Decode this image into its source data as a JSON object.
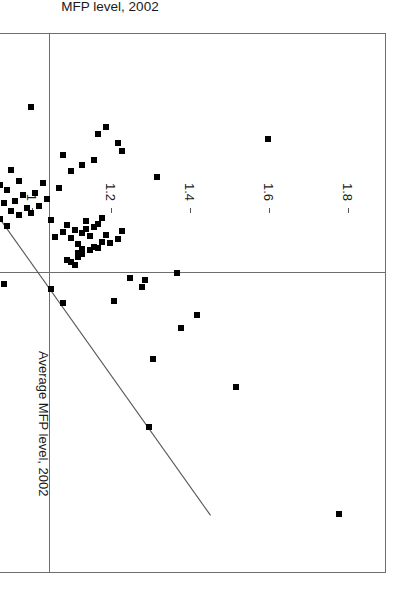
{
  "chart_data": {
    "type": "scatter",
    "title": "",
    "xlabel": "Growth among new firms within a given industry",
    "ylabel": "MFP level, 2002",
    "xlim": [
      -150,
      300
    ],
    "ylim": [
      0.5,
      1.9
    ],
    "grid": false,
    "legend": null,
    "x_ticks": [
      -150,
      -100,
      -50,
      0,
      50,
      100,
      150,
      200,
      250,
      300
    ],
    "x_tick_labels": [
      "-150",
      "-100",
      "-50",
      "0",
      "50",
      "100",
      "150",
      "200",
      "250",
      "300"
    ],
    "y_ticks": [
      0.6,
      0.8,
      1.0,
      1.2,
      1.4,
      1.6,
      1.8
    ],
    "y_tick_labels": [
      "0.6",
      "0.8",
      "1",
      "1.2",
      "1.4",
      "1.6",
      "1.8"
    ],
    "annotations": [
      {
        "text": "Average MFP level, 2002",
        "type": "vertical-reference-line",
        "y_value": 1.0
      }
    ],
    "reference_lines": [
      {
        "orientation": "horizontal",
        "value": 0,
        "axis": "x-growth"
      },
      {
        "orientation": "vertical",
        "value": 1.0,
        "axis": "y-mfp",
        "label": "Average MFP level, 2002"
      }
    ],
    "trendline": {
      "type": "linear",
      "x_start": -88,
      "y_start": 0.72,
      "x_end": 252,
      "y_end": 1.455
    },
    "marker": {
      "shape": "square",
      "color": "#000000",
      "size": 6
    },
    "points": [
      [
        251,
        1.78
      ],
      [
        178,
        1.3
      ],
      [
        145,
        1.52
      ],
      [
        122,
        1.31
      ],
      [
        96,
        1.38
      ],
      [
        85,
        1.42
      ],
      [
        75,
        1.08
      ],
      [
        73,
        1.21
      ],
      [
        63,
        1.05
      ],
      [
        62,
        1.28
      ],
      [
        59,
        0.93
      ],
      [
        56,
        1.29
      ],
      [
        54,
        1.25
      ],
      [
        50,
        1.37
      ],
      [
        43,
        1.11
      ],
      [
        41,
        1.1
      ],
      [
        39,
        1.09
      ],
      [
        37,
        1.12
      ],
      [
        36,
        0.78
      ],
      [
        34,
        1.13
      ],
      [
        33,
        1.12
      ],
      [
        31,
        1.15
      ],
      [
        30,
        1.13
      ],
      [
        29,
        1.17
      ],
      [
        28,
        1.16
      ],
      [
        26,
        1.12
      ],
      [
        25,
        1.2
      ],
      [
        24,
        1.18
      ],
      [
        22,
        1.22
      ],
      [
        21,
        1.1
      ],
      [
        20,
        1.06
      ],
      [
        19,
        1.15
      ],
      [
        18,
        1.19
      ],
      [
        17,
        1.13
      ],
      [
        16,
        1.08
      ],
      [
        15,
        1.23
      ],
      [
        14,
        1.11
      ],
      [
        13,
        1.14
      ],
      [
        12,
        1.16
      ],
      [
        11,
        0.94
      ],
      [
        10,
        1.09
      ],
      [
        9,
        1.17
      ],
      [
        8,
        0.88
      ],
      [
        7,
        1.14
      ],
      [
        6,
        1.05
      ],
      [
        5,
        0.92
      ],
      [
        4,
        1.18
      ],
      [
        3,
        0.83
      ],
      [
        2,
        0.97
      ],
      [
        1,
        0.86
      ],
      [
        0.5,
        0.6
      ],
      [
        0,
        1.0
      ],
      [
        -1,
        0.9
      ],
      [
        -2,
        0.95
      ],
      [
        -3,
        0.84
      ],
      [
        -4,
        0.99
      ],
      [
        -5,
        0.87
      ],
      [
        -6,
        1.02
      ],
      [
        -7,
        0.79
      ],
      [
        -8,
        0.93
      ],
      [
        -9,
        0.82
      ],
      [
        -10,
        0.96
      ],
      [
        -11,
        0.89
      ],
      [
        -12,
        1.04
      ],
      [
        -13,
        0.8
      ],
      [
        -14,
        0.91
      ],
      [
        -15,
        0.98
      ],
      [
        -16,
        0.85
      ],
      [
        -17,
        1.01
      ],
      [
        -18,
        0.77
      ],
      [
        -19,
        0.94
      ],
      [
        -20,
        0.88
      ],
      [
        -21,
        1.07
      ],
      [
        -22,
        0.81
      ],
      [
        -23,
        0.92
      ],
      [
        -24,
        0.75
      ],
      [
        -25,
        1.03
      ],
      [
        -26,
        0.86
      ],
      [
        -27,
        0.97
      ],
      [
        -28,
        0.79
      ],
      [
        -30,
        1.32
      ],
      [
        -31,
        0.9
      ],
      [
        -33,
        0.83
      ],
      [
        -35,
        1.1
      ],
      [
        -36,
        0.95
      ],
      [
        -38,
        0.87
      ],
      [
        -40,
        1.13
      ],
      [
        -42,
        0.78
      ],
      [
        -44,
        1.16
      ],
      [
        -46,
        0.91
      ],
      [
        -48,
        1.08
      ],
      [
        -52,
        1.23
      ],
      [
        -58,
        1.22
      ],
      [
        -62,
        1.6
      ],
      [
        -66,
        1.17
      ],
      [
        -72,
        1.19
      ],
      [
        -88,
        1.0
      ]
    ]
  }
}
